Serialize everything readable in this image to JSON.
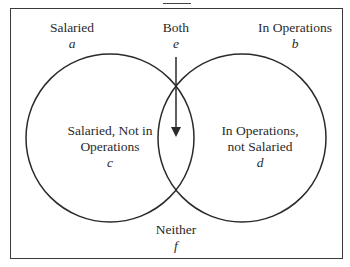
{
  "caption": {
    "text": "Venn diagram with sets Salaried and In Operations",
    "visible_fragment": "...ny"
  },
  "diagram": {
    "regions": {
      "salaried": {
        "label": "Salaried",
        "var": "a"
      },
      "both": {
        "label": "Both",
        "var": "e"
      },
      "operations": {
        "label": "In Operations",
        "var": "b"
      },
      "salaried_only": {
        "label_line1": "Salaried, Not in",
        "label_line2": "Operations",
        "var": "c"
      },
      "operations_only": {
        "label_line1": "In Operations,",
        "label_line2": "not Salaried",
        "var": "d"
      },
      "neither": {
        "label": "Neither",
        "var": "f"
      }
    },
    "colors": {
      "stroke": "#2a2a2a",
      "frame": "#3a3a3a",
      "background": "#ffffff"
    }
  }
}
